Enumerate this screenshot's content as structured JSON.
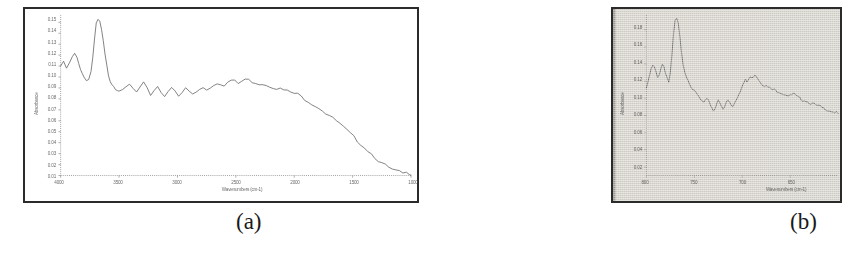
{
  "figure": {
    "caption_a": "(a)",
    "caption_b": "(b)"
  },
  "chart_data": [
    {
      "id": "panel-a",
      "type": "line",
      "title": "",
      "xlabel": "Wavenumbers (cm-1)",
      "ylabel": "Absorbance",
      "xlim": [
        4000,
        1000
      ],
      "ylim": [
        0.01,
        0.155
      ],
      "x_ticks": [
        4000,
        3500,
        3000,
        2500,
        2000,
        1500,
        1000
      ],
      "x_tick_labels": [
        "4000",
        "3500",
        "3000",
        "2500",
        "2000",
        "1500",
        "1000"
      ],
      "y_ticks": [
        0.15,
        0.14,
        0.13,
        0.12,
        0.11,
        0.1,
        0.09,
        0.08,
        0.07,
        0.06,
        0.05,
        0.04,
        0.03,
        0.02,
        0.01
      ],
      "y_tick_labels": [
        "0.15",
        "0.14",
        "0.13",
        "0.12",
        "0.11",
        "0.10",
        "0.09",
        "0.08",
        "0.07",
        "0.06",
        "0.05",
        "0.04",
        "0.03",
        "0.02",
        "0.01"
      ],
      "grid": false,
      "legend": "none",
      "series": [
        {
          "name": "Absorbance spectrum",
          "color": "#6b6b6b",
          "x": [
            4000,
            3975,
            3950,
            3925,
            3900,
            3880,
            3860,
            3845,
            3830,
            3815,
            3800,
            3780,
            3760,
            3740,
            3725,
            3710,
            3695,
            3680,
            3665,
            3650,
            3635,
            3620,
            3605,
            3590,
            3575,
            3560,
            3545,
            3530,
            3515,
            3500,
            3470,
            3440,
            3410,
            3380,
            3350,
            3320,
            3290,
            3260,
            3230,
            3200,
            3170,
            3140,
            3110,
            3080,
            3050,
            3020,
            2990,
            2960,
            2930,
            2900,
            2870,
            2840,
            2810,
            2780,
            2750,
            2720,
            2690,
            2660,
            2630,
            2600,
            2570,
            2540,
            2510,
            2480,
            2450,
            2420,
            2390,
            2360,
            2330,
            2300,
            2270,
            2240,
            2210,
            2180,
            2150,
            2120,
            2090,
            2060,
            2030,
            2000,
            1970,
            1940,
            1910,
            1880,
            1850,
            1820,
            1790,
            1760,
            1730,
            1700,
            1670,
            1640,
            1610,
            1580,
            1550,
            1520,
            1490,
            1460,
            1430,
            1400,
            1370,
            1340,
            1310,
            1280,
            1250,
            1220,
            1190,
            1160,
            1130,
            1100,
            1070,
            1040,
            1010,
            1000
          ],
          "y": [
            0.11,
            0.113,
            0.108,
            0.112,
            0.118,
            0.121,
            0.117,
            0.112,
            0.108,
            0.104,
            0.1,
            0.097,
            0.099,
            0.105,
            0.118,
            0.134,
            0.148,
            0.152,
            0.15,
            0.143,
            0.132,
            0.12,
            0.11,
            0.102,
            0.097,
            0.094,
            0.092,
            0.09,
            0.089,
            0.088,
            0.087,
            0.09,
            0.093,
            0.089,
            0.086,
            0.09,
            0.094,
            0.089,
            0.084,
            0.088,
            0.092,
            0.086,
            0.083,
            0.088,
            0.091,
            0.086,
            0.082,
            0.085,
            0.09,
            0.087,
            0.084,
            0.086,
            0.089,
            0.091,
            0.089,
            0.09,
            0.093,
            0.095,
            0.094,
            0.093,
            0.095,
            0.097,
            0.096,
            0.094,
            0.096,
            0.098,
            0.097,
            0.096,
            0.095,
            0.094,
            0.094,
            0.093,
            0.092,
            0.091,
            0.09,
            0.089,
            0.088,
            0.087,
            0.086,
            0.085,
            0.084,
            0.082,
            0.08,
            0.078,
            0.076,
            0.074,
            0.072,
            0.07,
            0.067,
            0.065,
            0.062,
            0.06,
            0.057,
            0.054,
            0.051,
            0.048,
            0.045,
            0.042,
            0.039,
            0.036,
            0.033,
            0.03,
            0.027,
            0.024,
            0.021,
            0.019,
            0.017,
            0.015,
            0.014,
            0.013,
            0.012,
            0.012,
            0.012,
            0.012
          ]
        }
      ]
    },
    {
      "id": "panel-b",
      "type": "line",
      "title": "",
      "xlabel": "Wavenumbers (cm-1)",
      "ylabel": "Absorbance",
      "xlim": [
        800,
        680
      ],
      "ylim": [
        0.01,
        0.195
      ],
      "x_ticks": [
        800,
        770,
        740,
        710
      ],
      "x_tick_labels": [
        "800",
        "750",
        "700",
        "650"
      ],
      "y_ticks": [
        0.18,
        0.16,
        0.14,
        0.12,
        0.1,
        0.08,
        0.06,
        0.04,
        0.02
      ],
      "y_tick_labels": [
        "0.18",
        "0.16",
        "0.14",
        "0.12",
        "0.10",
        "0.08",
        "0.06",
        "0.04",
        "0.02"
      ],
      "grid": false,
      "legend": "none",
      "series": [
        {
          "name": "Absorbance spectrum",
          "color": "#5e5e5e",
          "x": [
            800,
            799,
            798,
            797,
            796,
            795,
            794,
            793,
            792,
            791,
            790,
            789,
            788,
            787,
            786,
            785,
            784,
            783,
            782,
            781,
            780,
            779,
            778,
            777,
            776,
            775,
            774,
            773,
            772,
            771,
            770,
            769,
            768,
            767,
            766,
            765,
            764,
            763,
            762,
            761,
            760,
            759,
            758,
            757,
            756,
            755,
            754,
            753,
            752,
            751,
            750,
            749,
            748,
            747,
            746,
            745,
            744,
            743,
            742,
            741,
            740,
            739,
            738,
            737,
            736,
            735,
            734,
            733,
            732,
            731,
            730,
            729,
            728,
            727,
            726,
            725,
            724,
            723,
            722,
            721,
            720,
            719,
            718,
            717,
            716,
            715,
            714,
            713,
            712,
            711,
            710,
            709,
            708,
            707,
            706,
            705,
            704,
            703,
            702,
            701,
            700,
            699,
            698,
            697,
            696,
            695,
            694,
            693,
            692,
            691,
            690,
            689,
            688,
            687,
            686,
            685,
            684,
            683,
            682,
            681,
            680
          ],
          "y": [
            0.112,
            0.118,
            0.127,
            0.134,
            0.138,
            0.136,
            0.13,
            0.124,
            0.128,
            0.135,
            0.14,
            0.137,
            0.13,
            0.124,
            0.119,
            0.13,
            0.15,
            0.175,
            0.19,
            0.193,
            0.186,
            0.17,
            0.152,
            0.14,
            0.132,
            0.126,
            0.122,
            0.118,
            0.114,
            0.111,
            0.108,
            0.106,
            0.104,
            0.101,
            0.098,
            0.096,
            0.094,
            0.097,
            0.101,
            0.098,
            0.093,
            0.089,
            0.086,
            0.089,
            0.094,
            0.097,
            0.094,
            0.09,
            0.087,
            0.09,
            0.095,
            0.098,
            0.096,
            0.093,
            0.091,
            0.094,
            0.098,
            0.102,
            0.106,
            0.11,
            0.114,
            0.118,
            0.121,
            0.119,
            0.122,
            0.125,
            0.123,
            0.126,
            0.128,
            0.126,
            0.123,
            0.12,
            0.118,
            0.116,
            0.115,
            0.114,
            0.113,
            0.112,
            0.111,
            0.11,
            0.11,
            0.109,
            0.108,
            0.108,
            0.107,
            0.106,
            0.105,
            0.105,
            0.104,
            0.103,
            0.103,
            0.104,
            0.105,
            0.104,
            0.102,
            0.101,
            0.1,
            0.099,
            0.098,
            0.098,
            0.097,
            0.096,
            0.095,
            0.094,
            0.094,
            0.093,
            0.092,
            0.091,
            0.091,
            0.09,
            0.089,
            0.088,
            0.088,
            0.087,
            0.086,
            0.086,
            0.085,
            0.084,
            0.084,
            0.083,
            0.082
          ]
        }
      ]
    }
  ]
}
